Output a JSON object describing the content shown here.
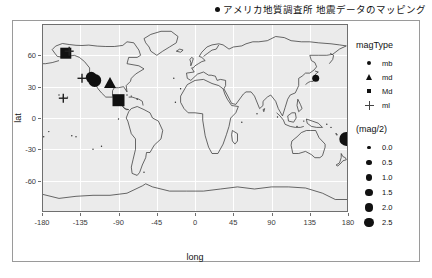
{
  "title": {
    "bullet_icon": "bullet-point",
    "text": "アメリカ地質調査所 地震データのマッピング"
  },
  "axes": {
    "x_title": "long",
    "y_title": "lat",
    "x_ticks": [
      "-180",
      "-135",
      "-90",
      "-45",
      "0",
      "45",
      "90",
      "135",
      "180"
    ],
    "y_ticks": [
      "60",
      "30",
      "0",
      "-30",
      "-60"
    ]
  },
  "legend": {
    "shape": {
      "title": "magType",
      "items": [
        {
          "label": "mb",
          "shape": "circle"
        },
        {
          "label": "md",
          "shape": "triangle"
        },
        {
          "label": "Md",
          "shape": "square"
        },
        {
          "label": "ml",
          "shape": "plus"
        }
      ]
    },
    "size": {
      "title": "(mag/2)",
      "items": [
        {
          "label": "0.0",
          "size": 5
        },
        {
          "label": "0.5",
          "size": 7
        },
        {
          "label": "1.0",
          "size": 8.5
        },
        {
          "label": "1.5",
          "size": 10
        },
        {
          "label": "2.0",
          "size": 11.5
        },
        {
          "label": "2.5",
          "size": 13
        }
      ]
    }
  },
  "chart_data": {
    "type": "scatter",
    "title": "アメリカ地質調査所 地震データのマッピング",
    "xlabel": "long",
    "ylabel": "lat",
    "xlim": [
      -180,
      180
    ],
    "ylim": [
      -90,
      90
    ],
    "grid": true,
    "legend_position": "right",
    "shape_encoding": "magType",
    "size_encoding": "(mag/2)",
    "basemap": "world-country-outlines",
    "points": [
      {
        "long": -152,
        "lat": 62,
        "magType": "Md",
        "size": 11
      },
      {
        "long": -148,
        "lat": 64,
        "magType": "ml",
        "size": 9
      },
      {
        "long": -118,
        "lat": 36,
        "magType": "mb",
        "size": 13
      },
      {
        "long": -122,
        "lat": 39,
        "magType": "mb",
        "size": 11
      },
      {
        "long": -133,
        "lat": 38,
        "magType": "ml",
        "size": 9
      },
      {
        "long": -155,
        "lat": 19,
        "magType": "ml",
        "size": 9
      },
      {
        "long": -100,
        "lat": 34,
        "magType": "md",
        "size": 12
      },
      {
        "long": -90,
        "lat": 17,
        "magType": "Md",
        "size": 12
      },
      {
        "long": 142,
        "lat": 38,
        "magType": "mb",
        "size": 7
      },
      {
        "long": 178,
        "lat": -20,
        "magType": "mb",
        "size": 14
      }
    ]
  }
}
